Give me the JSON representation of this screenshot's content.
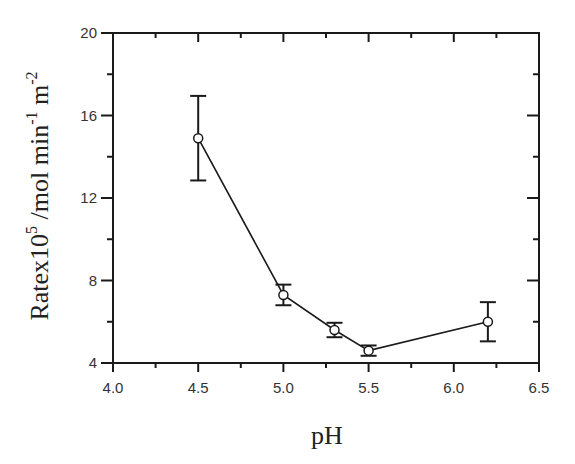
{
  "chart_data": {
    "type": "line",
    "title": "",
    "xlabel": "pH",
    "ylabel": "Ratex10^5 /mol min^-1 m^-2",
    "ylabel_parts": {
      "base1": "Ratex10",
      "sup1": "5",
      "base2": " /mol min",
      "sup2": "-1",
      "base3": " m",
      "sup3": "-2"
    },
    "xlim": [
      4.0,
      6.5
    ],
    "ylim": [
      4,
      20
    ],
    "x_ticks": [
      "4.0",
      "4.5",
      "5.0",
      "5.5",
      "6.0",
      "6.5"
    ],
    "y_ticks": [
      "4",
      "8",
      "12",
      "16",
      "20"
    ],
    "grid": false,
    "legend": null,
    "series": [
      {
        "name": "Rate",
        "marker": "open-circle",
        "x": [
          4.5,
          5.0,
          5.3,
          5.5,
          6.2
        ],
        "y": [
          14.9,
          7.3,
          5.6,
          4.6,
          6.0
        ],
        "error_low": [
          12.85,
          6.8,
          5.25,
          4.35,
          5.05
        ],
        "error_high": [
          16.95,
          7.8,
          5.95,
          4.85,
          6.95
        ]
      }
    ]
  },
  "colors": {
    "axis": "#1a1a1a",
    "line": "#1a1a1a",
    "marker_fill": "#ffffff"
  }
}
